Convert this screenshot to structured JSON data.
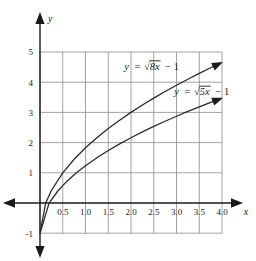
{
  "chart_data": {
    "type": "line",
    "title": "",
    "xlabel": "x",
    "ylabel": "y",
    "xlim": [
      -0.35,
      4.3
    ],
    "ylim": [
      -1.45,
      5.4
    ],
    "grid": true,
    "legend_position": "inline-annotations",
    "x_ticks": [
      "0.5",
      "1.0",
      "1.5",
      "2.0",
      "2.5",
      "3.0",
      "3.5",
      "4.0"
    ],
    "x_tick_values": [
      0.5,
      1.0,
      1.5,
      2.0,
      2.5,
      3.0,
      3.5,
      4.0
    ],
    "y_ticks": [
      "5",
      "4",
      "3",
      "2",
      "1",
      "-1"
    ],
    "y_tick_values": [
      5,
      4,
      3,
      2,
      1,
      -1
    ],
    "series": [
      {
        "name": "y = √8x − 1",
        "expression": "sqrt(8x) - 1",
        "coefficient": 8,
        "offset": -1,
        "color": "#2b2b2b",
        "x": [
          0,
          0.125,
          0.25,
          0.5,
          0.75,
          1.0,
          1.25,
          1.5,
          1.75,
          2.0,
          2.25,
          2.5,
          2.75,
          3.0,
          3.25,
          3.5,
          3.75,
          3.9
        ],
        "values": [
          -1,
          0,
          0.414,
          1.0,
          1.449,
          1.828,
          2.162,
          2.464,
          2.742,
          3.0,
          3.243,
          3.472,
          3.69,
          3.899,
          4.099,
          4.292,
          4.477,
          4.586
        ]
      },
      {
        "name": "y = √5x − 1",
        "expression": "sqrt(5x) - 1",
        "coefficient": 5,
        "offset": -1,
        "color": "#2b2b2b",
        "x": [
          0,
          0.2,
          0.4,
          0.6,
          0.8,
          1.0,
          1.25,
          1.5,
          1.75,
          2.0,
          2.25,
          2.5,
          2.75,
          3.0,
          3.25,
          3.5,
          3.75,
          3.9
        ],
        "values": [
          -1,
          0,
          0.414,
          0.732,
          1.0,
          1.236,
          1.5,
          1.739,
          1.958,
          2.162,
          2.354,
          2.536,
          2.708,
          2.873,
          3.031,
          3.183,
          3.33,
          3.416
        ]
      }
    ],
    "annotations": [
      {
        "id": "label-curve-8x",
        "text_parts": {
          "lhs": "y",
          "eq": "=",
          "radical": "√",
          "radicand": "8x",
          "tail": "− 1"
        },
        "full_text": "y = √8x − 1",
        "at_x": 1.85,
        "at_y": 4.42
      },
      {
        "id": "label-curve-5x",
        "text_parts": {
          "lhs": "y",
          "eq": "=",
          "radical": "√",
          "radicand": "5x",
          "tail": "− 1"
        },
        "full_text": "y = √5x − 1",
        "at_x": 2.95,
        "at_y": 3.58
      }
    ],
    "axis_arrows": {
      "x_positive": true,
      "x_negative": true,
      "y_positive": true,
      "y_negative": true
    },
    "curve_end_arrows": true
  },
  "figure": {
    "axis_label_x": "x",
    "axis_label_y": "y"
  },
  "colors": {
    "grid": "#8c8c8c",
    "axis": "#1a1a1a",
    "curve": "#2b2b2b",
    "background": "#ffffff",
    "text": "#1a1a1a"
  }
}
